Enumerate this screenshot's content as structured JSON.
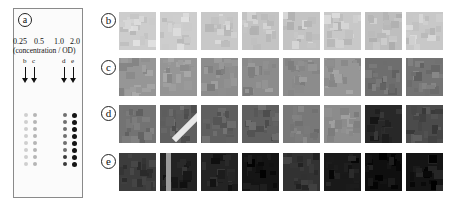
{
  "panel_a": {
    "label": "a",
    "concentrations": [
      "0.25",
      "0.5",
      "1.0",
      "2.0"
    ],
    "concentration_caption": "(concentration / OD)",
    "column_labels": [
      "b",
      "c",
      "d",
      "e"
    ],
    "dot_rows": 8
  },
  "rows": [
    {
      "label": "b",
      "tiles": 8,
      "tone": "light gray"
    },
    {
      "label": "c",
      "tiles": 8,
      "tone": "medium gray"
    },
    {
      "label": "d",
      "tiles": 8,
      "tone": "dark gray"
    },
    {
      "label": "e",
      "tiles": 8,
      "tone": "near black"
    }
  ]
}
